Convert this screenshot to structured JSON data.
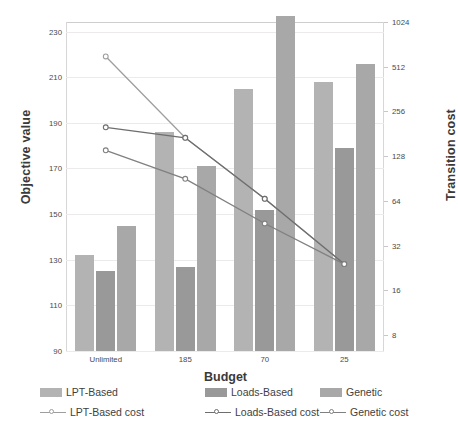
{
  "chart_data": {
    "type": "bar",
    "title": "",
    "xlabel": "Budget",
    "ylabel": "Objective value",
    "y2label": "Transition cost",
    "categories": [
      "Unlimited",
      "185",
      "70",
      "25"
    ],
    "ylim": [
      90,
      230
    ],
    "y_ticks": [
      90,
      110,
      130,
      150,
      170,
      190,
      210,
      230
    ],
    "y2lim": [
      8,
      1024
    ],
    "y2_scale": "log2",
    "y2_ticks": [
      8,
      16,
      32,
      64,
      128,
      256,
      512,
      1024
    ],
    "grid": true,
    "legend_position": "bottom",
    "series": [
      {
        "name": "LPT-Based",
        "kind": "bar",
        "axis": "left",
        "color": "#b3b3b3",
        "values": [
          132,
          186,
          205,
          208
        ]
      },
      {
        "name": "Loads-Based",
        "kind": "bar",
        "axis": "left",
        "color": "#999999",
        "values": [
          125,
          127,
          152,
          179
        ]
      },
      {
        "name": "Genetic",
        "kind": "bar",
        "axis": "left",
        "color": "#a8a8a8",
        "values": [
          145,
          171,
          237,
          216
        ]
      },
      {
        "name": "LPT-Based cost",
        "kind": "line",
        "axis": "right",
        "color": "#9e9e9e",
        "values": [
          600,
          170,
          66,
          24
        ]
      },
      {
        "name": "Loads-Based cost",
        "kind": "line",
        "axis": "right",
        "color": "#6e6e6e",
        "values": [
          200,
          170,
          66,
          24
        ]
      },
      {
        "name": "Genetic cost",
        "kind": "line",
        "axis": "right",
        "color": "#808080",
        "values": [
          140,
          90,
          45,
          24
        ]
      }
    ]
  },
  "axes": {
    "left_title": "Objective value",
    "right_title": "Transition cost",
    "bottom_title": "Budget",
    "left_ticks": [
      "230",
      "210",
      "190",
      "170",
      "150",
      "130",
      "110",
      "90"
    ],
    "right_ticks": [
      "1024",
      "512",
      "256",
      "128",
      "64",
      "32",
      "16",
      "8"
    ],
    "category_labels": [
      "Unlimited",
      "185",
      "70",
      "25"
    ]
  },
  "legend": {
    "bars": [
      {
        "label": "LPT-Based",
        "color": "#b3b3b3"
      },
      {
        "label": "Loads-Based",
        "color": "#999999"
      },
      {
        "label": "Genetic",
        "color": "#a8a8a8"
      }
    ],
    "lines": [
      {
        "label": "LPT-Based cost",
        "color": "#9e9e9e"
      },
      {
        "label": "Loads-Based cost",
        "color": "#6e6e6e"
      },
      {
        "label": "Genetic cost",
        "color": "#808080"
      }
    ]
  }
}
